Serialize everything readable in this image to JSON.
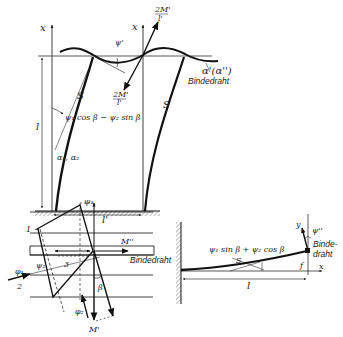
{
  "figure": {
    "top": {
      "axis_x_left": "x",
      "axis_x_right": "x",
      "psi_prime": "ψ'",
      "force_up": "2M'/l'",
      "force_up_num": "2M'",
      "force_up_den": "l'",
      "force_down_num": "2M'",
      "force_down_den": "l'",
      "alpha_label": "α'(α'')",
      "binding_wire": "Bindedraht",
      "blade_left": "S",
      "blade_right": "S",
      "height_label": "l",
      "width_label": "l'",
      "angle_expr": "ψ₁ cos β − ψ₂ sin β",
      "alpha_12": "α₁, α₂"
    },
    "bottom_left": {
      "psi1": "ψ₁",
      "psi2": "ψ₂",
      "label_1": "1",
      "label_2": "2",
      "label_3": "3",
      "phi1": "φ₁",
      "phi2": "φ₂",
      "moment_top": "M''",
      "moment_bottom": "M'",
      "beta": "β",
      "binding_wire": "Bindedraht"
    },
    "bottom_right": {
      "axis_y": "y",
      "axis_x": "x",
      "psi_dd": "ψ''",
      "expr": "ψ₁ sin β + ψ₂ cos β",
      "S": "S",
      "f": "f",
      "l": "l",
      "binding_wire_1": "Binde-",
      "binding_wire_2": "draht"
    }
  }
}
